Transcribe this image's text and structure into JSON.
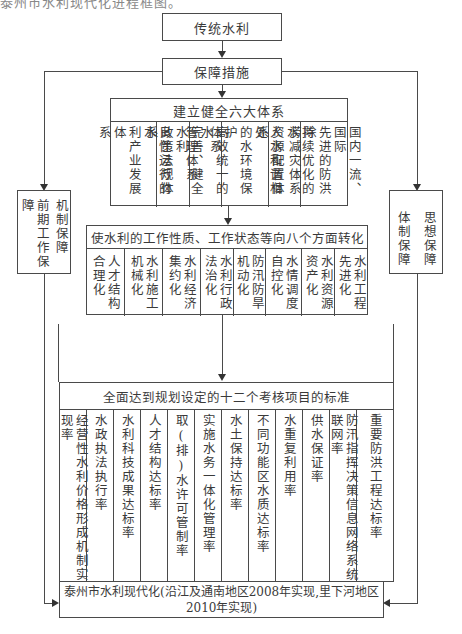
{
  "caption_cropped": "泰州市水利现代化进程框图。",
  "nodes": {
    "traditional": "传统水利",
    "measures": "保障措施",
    "six_systems": {
      "title": "建立健全六大体系",
      "items": [
        {
          "lines": [
            "良性运行的水",
            "利产业发展体",
            "系"
          ]
        },
        {
          "lines": [
            "完善、健全水利",
            "政策法规体系"
          ]
        },
        {
          "lines": [
            "高效统一的水",
            "管理体系"
          ]
        },
        {
          "lines": [
            "人水和谐相处",
            "的水环境保护",
            "体系"
          ]
        },
        {
          "lines": [
            "持续优化的水",
            "资源配置体系"
          ]
        },
        {
          "lines": [
            "国内一流、国际",
            "先进的防洪除",
            "涝减灾体系"
          ]
        }
      ]
    },
    "left_support": {
      "lines": [
        "机制保障",
        "前期工作保障"
      ]
    },
    "right_support": {
      "lines": [
        "思想保障",
        "体制保障"
      ]
    },
    "eight_aspects": {
      "title": "使水利的工作性质、工作状态等向八个方面转化",
      "items": [
        "人才结构合理化",
        "水利施工机械化",
        "水利经济集约化",
        "水利行政法治化",
        "防汛防旱机动化",
        "水情调度自控化",
        "水利资源资产化",
        "水利工程先进化"
      ]
    },
    "twelve_items": {
      "title": "全面达到规划设定的十二个考核项目的标准",
      "items": [
        "经营性水利价格形成机制实现率",
        "水政执法执行率",
        "水利科技成果达标率",
        "人才结构达标率",
        "取(排)水许可管制率",
        "实施水务一体化管理率",
        "水土保持达标率",
        "不同功能区水质达标率",
        "水重复利用率",
        "供水保证率",
        "防汛指挥决策信息网络系统联网率",
        "重要防洪工程达标率"
      ]
    },
    "goal": {
      "line1": "泰州市水利现代化(沿江及通南地区2008年实现,里下河地区",
      "line2": "2010年实现)"
    }
  }
}
